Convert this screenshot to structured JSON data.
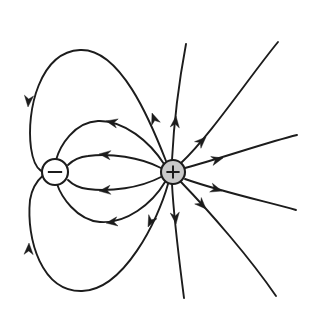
{
  "figure": {
    "type": "electric-field-line-diagram",
    "width": 315,
    "height": 320,
    "background_color": "#ffffff",
    "line_color": "#1c1c1c",
    "line_width": 1.9
  },
  "charges": [
    {
      "id": "negative-charge",
      "sign": "minus",
      "symbol": "−",
      "cx": 55,
      "cy": 172,
      "r": 13,
      "fill": "#ffffff",
      "stroke": "#1c1c1c",
      "label": "negative point charge"
    },
    {
      "id": "positive-charge",
      "sign": "plus",
      "symbol": "+",
      "cx": 173,
      "cy": 172,
      "r": 12,
      "fill": "#c9c9c9",
      "stroke": "#1c1c1c",
      "label": "positive point charge"
    }
  ],
  "chart_data": {
    "type": "line",
    "xlabel": "",
    "ylabel": "",
    "grid": false,
    "legend": "none",
    "xlim": [
      0,
      315
    ],
    "ylim": [
      0,
      320
    ],
    "annotations": [
      "Arrows point away from the positive charge (+) and toward the negative charge (−).",
      "Four closed field lines connect + to − (two wide outer loops, two narrow inner lines).",
      "Six field lines radiate outward from + and leave the frame on the right, top and bottom."
    ],
    "series": [
      {
        "name": "outer-loop-top",
        "kind": "closed-loop",
        "from": "positive-charge",
        "to": "negative-charge",
        "path": "M 166 161 C 150 120 120 48 80 50 C 40 52 26 110 31 148 C 35 176 48 172 44 171",
        "arrows": [
          {
            "x": 152,
            "y": 113,
            "angle": -110,
            "direction": "up-left"
          },
          {
            "x": 28,
            "y": 107,
            "angle": 95,
            "direction": "down"
          }
        ]
      },
      {
        "name": "inner-loop-upper",
        "kind": "closed-loop",
        "from": "positive-charge",
        "to": "negative-charge",
        "path": "M 164 164 C 150 142 124 120 98 121 C 74 122 60 146 56 160",
        "arrows": [
          {
            "x": 106,
            "y": 121,
            "angle": 192,
            "direction": "left"
          }
        ]
      },
      {
        "name": "inner-line-upper-mid",
        "kind": "closed-loop",
        "from": "positive-charge",
        "to": "negative-charge",
        "path": "M 161 168 C 140 157 110 153 88 156 C 78 157 72 161 68 165",
        "arrows": [
          {
            "x": 99,
            "y": 154,
            "angle": 186,
            "direction": "left"
          }
        ]
      },
      {
        "name": "inner-line-lower-mid",
        "kind": "closed-loop",
        "from": "positive-charge",
        "to": "negative-charge",
        "path": "M 161 177 C 140 188 110 192 88 189 C 78 188 72 184 68 180",
        "arrows": [
          {
            "x": 99,
            "y": 191,
            "angle": 174,
            "direction": "left"
          }
        ]
      },
      {
        "name": "inner-loop-lower",
        "kind": "closed-loop",
        "from": "positive-charge",
        "to": "negative-charge",
        "path": "M 165 182 C 152 204 126 224 100 222 C 76 220 61 196 57 184",
        "arrows": [
          {
            "x": 106,
            "y": 223,
            "angle": 172,
            "direction": "left"
          }
        ]
      },
      {
        "name": "outer-loop-bottom",
        "kind": "closed-loop",
        "from": "positive-charge",
        "to": "negative-charge",
        "path": "M 168 184 C 158 220 124 290 82 291 C 42 292 26 240 30 200 C 33 180 46 174 44 174",
        "arrows": [
          {
            "x": 148,
            "y": 227,
            "angle": 115,
            "direction": "down-left"
          },
          {
            "x": 29,
            "y": 243,
            "angle": -88,
            "direction": "up"
          }
        ]
      },
      {
        "name": "radial-line-up",
        "kind": "open-radial",
        "from": "positive-charge",
        "to": "frame-top",
        "path": "M 172 160 C 174 120 180 76 186 44",
        "arrows": [
          {
            "x": 176,
            "y": 116,
            "angle": -84,
            "direction": "up"
          }
        ]
      },
      {
        "name": "radial-line-up-right",
        "kind": "open-radial",
        "from": "positive-charge",
        "to": "frame-top-right",
        "path": "M 181 163 C 210 136 250 76 278 42",
        "arrows": [
          {
            "x": 206,
            "y": 137,
            "angle": -44,
            "direction": "up-right"
          }
        ]
      },
      {
        "name": "radial-line-right-upper",
        "kind": "open-radial",
        "from": "positive-charge",
        "to": "frame-right",
        "path": "M 185 168 C 222 158 268 142 297 135",
        "arrows": [
          {
            "x": 223,
            "y": 158,
            "angle": -15,
            "direction": "right"
          }
        ]
      },
      {
        "name": "radial-line-right-lower",
        "kind": "open-radial",
        "from": "positive-charge",
        "to": "frame-right",
        "path": "M 185 179 C 222 192 268 202 296 210",
        "arrows": [
          {
            "x": 222,
            "y": 191,
            "angle": 17,
            "direction": "right"
          }
        ]
      },
      {
        "name": "radial-line-down-right",
        "kind": "open-radial",
        "from": "positive-charge",
        "to": "frame-bottom-right",
        "path": "M 181 182 C 210 212 250 258 276 296",
        "arrows": [
          {
            "x": 206,
            "y": 209,
            "angle": 46,
            "direction": "down-right"
          }
        ]
      },
      {
        "name": "radial-line-down",
        "kind": "open-radial",
        "from": "positive-charge",
        "to": "frame-bottom",
        "path": "M 172 184 C 174 222 180 266 184 298",
        "arrows": [
          {
            "x": 176,
            "y": 224,
            "angle": 84,
            "direction": "down"
          }
        ]
      }
    ]
  }
}
